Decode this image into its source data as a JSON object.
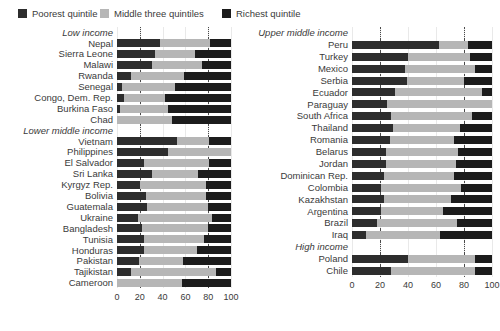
{
  "legend": {
    "items": [
      {
        "label": "Poorest quintile",
        "color": "#2d2d2d",
        "icon": "square-swatch-icon"
      },
      {
        "label": "Middle three quintiles",
        "color": "#b6b6b6",
        "icon": "square-swatch-icon"
      },
      {
        "label": "Richest quintile",
        "color": "#1c1c1c",
        "icon": "square-swatch-icon"
      }
    ]
  },
  "colors": {
    "poorest": "#2d2d2d",
    "middle": "#b6b6b6",
    "richest": "#1c1c1c",
    "gridline": "#e9e9e9",
    "refline": "#4a4a4a",
    "text": "#3a3a3a",
    "background": "#ffffff"
  },
  "axis": {
    "min": 0,
    "max": 100,
    "ticks": [
      "0",
      "20",
      "40",
      "60",
      "80",
      "100"
    ],
    "tick_values": [
      0,
      20,
      40,
      60,
      80,
      100
    ],
    "reference_lines": [
      20,
      80
    ],
    "grid": true
  },
  "chart_data": {
    "type": "bar",
    "subtype": "stacked-horizontal-100pct",
    "title": "",
    "subtitle": "",
    "xlabel": "",
    "ylabel": "",
    "xlim": [
      0,
      100
    ],
    "grid": true,
    "legend_position": "top-left",
    "series": [
      {
        "name": "Poorest quintile",
        "color": "#2d2d2d"
      },
      {
        "name": "Middle three quintiles",
        "color": "#b6b6b6"
      },
      {
        "name": "Richest quintile",
        "color": "#1c1c1c"
      }
    ],
    "panels": [
      {
        "id": "left",
        "rows": [
          {
            "label": "Low income",
            "group": true
          },
          {
            "label": "Nepal",
            "values": [
              38,
              44,
              18
            ]
          },
          {
            "label": "Sierra Leone",
            "values": [
              33,
              35,
              32
            ]
          },
          {
            "label": "Malawi",
            "values": [
              31,
              44,
              25
            ]
          },
          {
            "label": "Rwanda",
            "values": [
              12,
              47,
              41
            ]
          },
          {
            "label": "Senegal",
            "values": [
              4,
              47,
              49
            ]
          },
          {
            "label": "Congo, Dem. Rep.",
            "values": [
              6,
              36,
              58
            ]
          },
          {
            "label": "Burkina Faso",
            "values": [
              3,
              42,
              55
            ]
          },
          {
            "label": "Chad",
            "values": [
              0,
              48,
              52
            ]
          },
          {
            "label": "Lower middle income",
            "group": true
          },
          {
            "label": "Vietnam",
            "values": [
              53,
              28,
              19
            ]
          },
          {
            "label": "Philippines",
            "values": [
              45,
              55,
              0
            ]
          },
          {
            "label": "El Salvador",
            "values": [
              24,
              57,
              19
            ]
          },
          {
            "label": "Sri Lanka",
            "values": [
              31,
              40,
              29
            ]
          },
          {
            "label": "Kyrgyz Rep.",
            "values": [
              20,
              58,
              22
            ]
          },
          {
            "label": "Bolivia",
            "values": [
              25,
              53,
              22
            ]
          },
          {
            "label": "Guatemala",
            "values": [
              26,
              54,
              20
            ]
          },
          {
            "label": "Ukraine",
            "values": [
              18,
              65,
              17
            ]
          },
          {
            "label": "Bangladesh",
            "values": [
              22,
              58,
              20
            ]
          },
          {
            "label": "Tunisia",
            "values": [
              24,
              52,
              24
            ]
          },
          {
            "label": "Honduras",
            "values": [
              24,
              46,
              30
            ]
          },
          {
            "label": "Pakistan",
            "values": [
              19,
              39,
              42
            ]
          },
          {
            "label": "Tajikistan",
            "values": [
              12,
              75,
              13
            ]
          },
          {
            "label": "Cameroon",
            "values": [
              0,
              57,
              43
            ]
          }
        ]
      },
      {
        "id": "right",
        "rows": [
          {
            "label": "Upper middle income",
            "group": true
          },
          {
            "label": "Peru",
            "values": [
              62,
              21,
              17
            ]
          },
          {
            "label": "Turkey",
            "values": [
              40,
              44,
              16
            ]
          },
          {
            "label": "Mexico",
            "values": [
              38,
              50,
              12
            ]
          },
          {
            "label": "Serbia",
            "values": [
              39,
              41,
              20
            ]
          },
          {
            "label": "Ecuador",
            "values": [
              31,
              62,
              7
            ]
          },
          {
            "label": "Paraguay",
            "values": [
              25,
              75,
              0
            ]
          },
          {
            "label": "South Africa",
            "values": [
              28,
              58,
              14
            ]
          },
          {
            "label": "Thailand",
            "values": [
              29,
              48,
              23
            ]
          },
          {
            "label": "Romania",
            "values": [
              27,
              46,
              27
            ]
          },
          {
            "label": "Belarus",
            "values": [
              24,
              52,
              24
            ]
          },
          {
            "label": "Jordan",
            "values": [
              24,
              50,
              26
            ]
          },
          {
            "label": "Dominican Rep.",
            "values": [
              23,
              50,
              27
            ]
          },
          {
            "label": "Colombia",
            "values": [
              21,
              57,
              22
            ]
          },
          {
            "label": "Kazakhstan",
            "values": [
              23,
              48,
              29
            ]
          },
          {
            "label": "Argentina",
            "values": [
              21,
              44,
              35
            ]
          },
          {
            "label": "Brazil",
            "values": [
              18,
              57,
              25
            ]
          },
          {
            "label": "Iraq",
            "values": [
              10,
              53,
              37
            ]
          },
          {
            "label": "High income",
            "group": true
          },
          {
            "label": "Poland",
            "values": [
              40,
              48,
              12
            ]
          },
          {
            "label": "Chile",
            "values": [
              28,
              60,
              12
            ]
          }
        ]
      }
    ]
  }
}
